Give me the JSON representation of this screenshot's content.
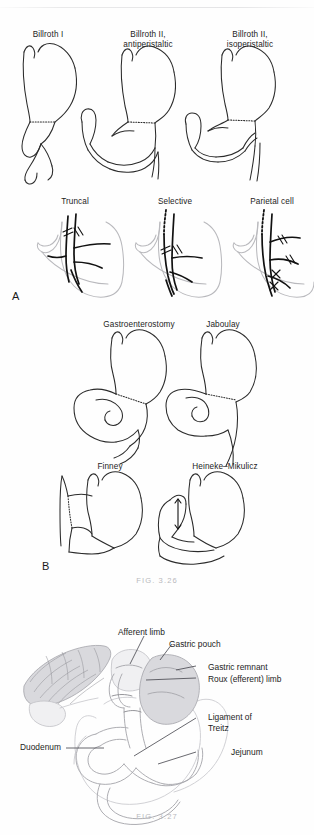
{
  "page": {
    "background_color": "#fefefe",
    "rule_color": "#e6e6e8"
  },
  "figures": [
    {
      "id": "fig-3-26",
      "caption": "FIG. 3.26",
      "caption_color": "#b9b9bd",
      "panels": [
        {
          "letter": "A",
          "rows": [
            {
              "name": "reconstruction-row",
              "items": [
                {
                  "label": "Billroth I"
                },
                {
                  "label": "Billroth II,\nantiperistaltic"
                },
                {
                  "label": "Billroth II,\nisoperistaltic"
                }
              ]
            },
            {
              "name": "vagotomy-row",
              "items": [
                {
                  "label": "Truncal"
                },
                {
                  "label": "Selective"
                },
                {
                  "label": "Parietal cell"
                }
              ]
            }
          ]
        },
        {
          "letter": "B",
          "rows": [
            {
              "name": "drainage-row-1",
              "items": [
                {
                  "label": "Gastroenterostomy"
                },
                {
                  "label": "Jaboulay"
                }
              ]
            },
            {
              "name": "drainage-row-2",
              "items": [
                {
                  "label": "Finney"
                },
                {
                  "label": "Heineke–Mikulicz"
                }
              ]
            }
          ]
        }
      ]
    },
    {
      "id": "fig-3-27",
      "caption": "FIG. 3.27",
      "caption_color": "#b9b9bd",
      "labels": [
        {
          "text": "Afferent limb"
        },
        {
          "text": "Gastric pouch"
        },
        {
          "text": "Gastric remnant"
        },
        {
          "text": "Roux (efferent) limb"
        },
        {
          "text": "Ligament of\nTreitz"
        },
        {
          "text": "Duodenum"
        },
        {
          "text": "Jejunum"
        }
      ]
    }
  ],
  "labels": {
    "billroth_1": "Billroth I",
    "billroth_2_anti_line1": "Billroth II,",
    "billroth_2_anti_line2": "antiperistaltic",
    "billroth_2_iso_line1": "Billroth II,",
    "billroth_2_iso_line2": "isoperistaltic",
    "truncal": "Truncal",
    "selective": "Selective",
    "parietal_cell": "Parietal cell",
    "gastroenterostomy": "Gastroenterostomy",
    "jaboulay": "Jaboulay",
    "finney": "Finney",
    "heineke_mikulicz": "Heineke–Mikulicz",
    "panel_a": "A",
    "panel_b": "B",
    "caption_326": "FIG. 3.26",
    "caption_327": "FIG. 3.27",
    "afferent_limb": "Afferent limb",
    "gastric_pouch": "Gastric pouch",
    "gastric_remnant": "Gastric remnant",
    "roux_limb": "Roux (efferent) limb",
    "ligament_of_treitz_l1": "Ligament of",
    "ligament_of_treitz_l2": "Treitz",
    "duodenum": "Duodenum",
    "jejunum": "Jejunum"
  }
}
